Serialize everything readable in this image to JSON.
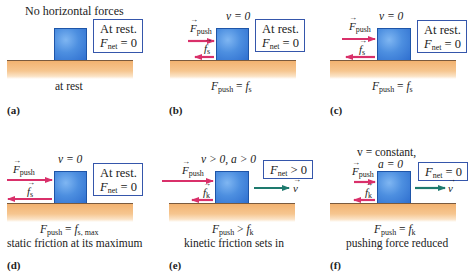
{
  "figure": {
    "colors": {
      "push_arrow": "#d9306a",
      "friction_arrow": "#d9306a",
      "velocity_arrow": "#1e7a6e",
      "block": "#3d80dc",
      "status_border": "#3556ab",
      "ground_line": "#7a5a3e",
      "ground_fill": "#f2b270"
    },
    "panels": [
      {
        "id": "a",
        "label": "(a)",
        "heading": "No horizontal forces",
        "status_line1": "At rest.",
        "status_line2_var": "F",
        "status_line2_sub": "net",
        "status_line2_rel": " = 0",
        "equation": "",
        "caption": "at rest"
      },
      {
        "id": "b",
        "label": "(b)",
        "velocity_text": "v = 0",
        "push_label": "F",
        "push_sub": "push",
        "friction_label": "f",
        "friction_sub": "s",
        "status_line1": "At rest.",
        "status_line2_var": "F",
        "status_line2_sub": "net",
        "status_line2_rel": " = 0",
        "eq_lhs": "F",
        "eq_lhs_sub": "push",
        "eq_rel": " = ",
        "eq_rhs": "f",
        "eq_rhs_sub": "s"
      },
      {
        "id": "c",
        "label": "(c)",
        "velocity_text": "v = 0",
        "push_label": "F",
        "push_sub": "push",
        "friction_label": "f",
        "friction_sub": "s",
        "status_line1": "At rest.",
        "status_line2_var": "F",
        "status_line2_sub": "net",
        "status_line2_rel": " = 0",
        "eq_lhs": "F",
        "eq_lhs_sub": "push",
        "eq_rel": " = ",
        "eq_rhs": "f",
        "eq_rhs_sub": "s"
      },
      {
        "id": "d",
        "label": "(d)",
        "velocity_text": "v = 0",
        "push_label": "F",
        "push_sub": "push",
        "friction_label": "f",
        "friction_sub": "s",
        "status_line1": "At rest.",
        "status_line2_var": "F",
        "status_line2_sub": "net",
        "status_line2_rel": " = 0",
        "eq_lhs": "F",
        "eq_lhs_sub": "push",
        "eq_rel": " = ",
        "eq_rhs": "f",
        "eq_rhs_sub": "s, max",
        "caption": "static friction at its maximum"
      },
      {
        "id": "e",
        "label": "(e)",
        "velocity_text": "v > 0, a > 0",
        "push_label": "F",
        "push_sub": "push",
        "friction_label": "f",
        "friction_sub": "k",
        "velocity_vec": "v",
        "status_var": "F",
        "status_sub": "net",
        "status_rel": " > 0",
        "eq_lhs": "F",
        "eq_lhs_sub": "push",
        "eq_rel": " > ",
        "eq_rhs": "f",
        "eq_rhs_sub": "k",
        "caption": "kinetic friction sets in"
      },
      {
        "id": "f",
        "label": "(f)",
        "velocity_text_1": "v = constant,",
        "velocity_text_2": "a = 0",
        "push_label": "F",
        "push_sub": "push",
        "friction_label": "f",
        "friction_sub": "k",
        "velocity_vec": "v",
        "status_var": "F",
        "status_sub": "net",
        "status_rel": " = 0",
        "eq_lhs": "F",
        "eq_lhs_sub": "push",
        "eq_rel": " = ",
        "eq_rhs": "f",
        "eq_rhs_sub": "k",
        "caption": "pushing force reduced"
      }
    ],
    "vector_arrow_glyph": "→"
  }
}
